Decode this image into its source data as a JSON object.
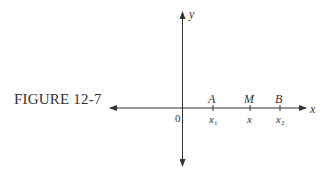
{
  "figure": {
    "caption": "FIGURE 12-7",
    "axes": {
      "x_label": "x",
      "y_label": "y",
      "origin_label": "0"
    },
    "points": [
      {
        "name": "A",
        "coord_label": "x",
        "sub": "1"
      },
      {
        "name": "M",
        "coord_label": "x",
        "sub": ""
      },
      {
        "name": "B",
        "coord_label": "x",
        "sub": "2"
      }
    ]
  }
}
